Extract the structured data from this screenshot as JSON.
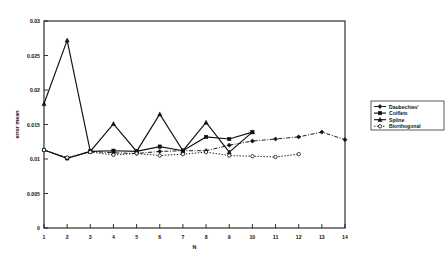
{
  "chart_data": {
    "type": "line",
    "title": "",
    "xlabel": "N",
    "ylabel": "error mean",
    "xlim": [
      1,
      14
    ],
    "ylim": [
      0,
      0.03
    ],
    "grid": false,
    "legend_position": "right-outside",
    "x_ticks": [
      1,
      2,
      3,
      4,
      5,
      6,
      7,
      8,
      9,
      10,
      11,
      12,
      13,
      14
    ],
    "x_tick_labels": [
      "1",
      "2",
      "3",
      "4",
      "5",
      "6",
      "7",
      "8",
      "9",
      "10",
      "11",
      "12",
      "13",
      "14"
    ],
    "y_ticks": [
      0,
      0.005,
      0.01,
      0.015,
      0.02,
      0.025,
      0.03
    ],
    "y_tick_labels": [
      "0",
      "0.005",
      "0.01",
      "0.015",
      "0.02",
      "0.025",
      "0.03"
    ],
    "series": [
      {
        "name": "Daubechies'",
        "style": "dash-dot",
        "marker": "diamond",
        "x": [
          1,
          2,
          3,
          4,
          5,
          6,
          7,
          8,
          9,
          10,
          11,
          12,
          13,
          14
        ],
        "values": [
          0.0113,
          0.0101,
          0.0111,
          0.0109,
          0.0108,
          0.0111,
          0.0112,
          0.0112,
          0.012,
          0.0126,
          0.0129,
          0.0132,
          0.0139,
          0.0128
        ]
      },
      {
        "name": "Coiflets",
        "style": "solid",
        "marker": "square",
        "x": [
          1,
          2,
          3,
          4,
          5,
          6,
          7,
          8,
          9,
          10
        ],
        "values": [
          0.0113,
          0.0101,
          0.0111,
          0.0112,
          0.0111,
          0.0118,
          0.0112,
          0.0132,
          0.0129,
          0.0139
        ]
      },
      {
        "name": "Spline",
        "style": "solid",
        "marker": "triangle",
        "x": [
          1,
          2,
          3,
          4,
          5,
          6,
          7,
          8,
          9,
          10
        ],
        "values": [
          0.018,
          0.0272,
          0.0111,
          0.0151,
          0.0111,
          0.0165,
          0.0112,
          0.0153,
          0.011,
          0.0139
        ]
      },
      {
        "name": "Biorthogonal",
        "style": "dotted",
        "marker": "circle",
        "x": [
          1,
          2,
          3,
          4,
          5,
          6,
          7,
          8,
          9,
          10,
          11,
          12
        ],
        "values": [
          0.0113,
          0.0102,
          0.011,
          0.0106,
          0.0108,
          0.0105,
          0.0107,
          0.011,
          0.0105,
          0.0104,
          0.0103,
          0.0107
        ]
      }
    ]
  },
  "legend": {
    "entries": [
      {
        "label": "Daubechies'"
      },
      {
        "label": "Coiflets"
      },
      {
        "label": "Spline"
      },
      {
        "label": "Biorthogonal"
      }
    ]
  },
  "colors": {
    "ink": "#111111",
    "background": "#ffffff"
  }
}
